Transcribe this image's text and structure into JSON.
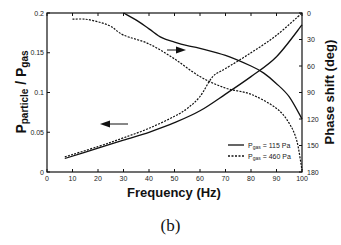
{
  "caption": "(b)",
  "chart_data": {
    "type": "line",
    "title": "",
    "xlabel": "Frequency (Hz)",
    "ylabel": "P_particle / P_gas",
    "ylabel_main": "P",
    "ylabel_sub1": "particle",
    "ylabel_mid": " / P",
    "ylabel_sub2": "gas",
    "y2label": "Phase shift (deg)",
    "xlim": [
      0,
      100
    ],
    "ylim": [
      0,
      0.2
    ],
    "y2lim": [
      0,
      180
    ],
    "y2_inverted": true,
    "x_ticks": [
      0,
      10,
      20,
      30,
      40,
      50,
      60,
      70,
      80,
      90,
      100
    ],
    "y_ticks": [
      "0",
      "0.05",
      "0.1",
      "0.15",
      "0.2"
    ],
    "y_tick_values": [
      0,
      0.05,
      0.1,
      0.15,
      0.2
    ],
    "y2_ticks": [
      0,
      30,
      60,
      90,
      120,
      150,
      180
    ],
    "grid": false,
    "legend": {
      "position": "lower right",
      "entries": [
        {
          "label_prefix": "P",
          "label_sub": "gas",
          "label_suffix": " = 115 Pa",
          "style": "solid"
        },
        {
          "label_prefix": "P",
          "label_sub": "gas",
          "label_suffix": " = 460 Pa",
          "style": "dashed"
        }
      ]
    },
    "annotations": [
      {
        "type": "arrow",
        "direction": "left",
        "meaning": "amplitude curves read on left axis"
      },
      {
        "type": "arrow",
        "direction": "right",
        "meaning": "phase curves read on right axis"
      }
    ],
    "series": [
      {
        "name": "Amplitude ratio, Pgas = 115 Pa",
        "axis": "left",
        "style": "solid",
        "x": [
          7,
          20,
          30,
          40,
          50,
          60,
          70,
          80,
          90,
          100
        ],
        "values": [
          0.017,
          0.03,
          0.04,
          0.05,
          0.062,
          0.077,
          0.098,
          0.12,
          0.145,
          0.185
        ]
      },
      {
        "name": "Amplitude ratio, Pgas = 460 Pa",
        "axis": "left",
        "style": "dashed",
        "x": [
          7,
          20,
          30,
          40,
          50,
          55,
          60,
          65,
          70,
          80,
          90,
          100
        ],
        "values": [
          0.019,
          0.032,
          0.043,
          0.055,
          0.07,
          0.08,
          0.095,
          0.12,
          0.13,
          0.15,
          0.172,
          0.2
        ]
      },
      {
        "name": "Phase shift, Pgas = 115 Pa",
        "axis": "right",
        "style": "solid",
        "x": [
          30,
          35,
          40,
          45,
          50,
          55,
          60,
          70,
          80,
          85,
          90,
          95,
          100
        ],
        "values": [
          0,
          8,
          18,
          28,
          33,
          37,
          40,
          48,
          60,
          68,
          80,
          95,
          120
        ]
      },
      {
        "name": "Phase shift, Pgas = 460 Pa",
        "axis": "right",
        "style": "dashed",
        "x": [
          10,
          15,
          20,
          25,
          30,
          40,
          50,
          60,
          70,
          80,
          90,
          95,
          98,
          100
        ],
        "values": [
          7,
          7,
          10,
          15,
          25,
          35,
          52,
          72,
          85,
          92,
          108,
          125,
          145,
          178
        ]
      }
    ]
  }
}
